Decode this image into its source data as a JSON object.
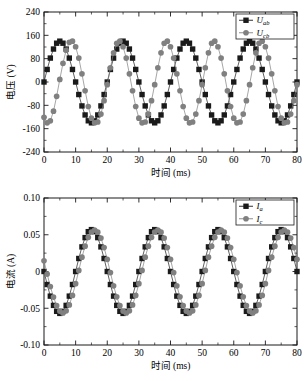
{
  "figure": {
    "background": "#ffffff",
    "series_colors": {
      "black": "#1a1a1a",
      "gray": "#808080"
    }
  },
  "chart_data": [
    {
      "type": "line",
      "title": "",
      "xlabel": "时间 (ms)",
      "ylabel": "电压 (V)",
      "xlim": [
        0,
        80
      ],
      "ylim": [
        -240,
        240
      ],
      "xticks": [
        0,
        10,
        20,
        30,
        40,
        50,
        60,
        70,
        80
      ],
      "yticks": [
        -240,
        -160,
        -80,
        0,
        80,
        160,
        240
      ],
      "xtick_labels": [
        "0",
        "10",
        "20",
        "30",
        "40",
        "50",
        "60",
        "70",
        "80"
      ],
      "ytick_labels": [
        "-240",
        "-160",
        "-80",
        "0",
        "80",
        "160",
        "240"
      ],
      "grid": false,
      "legend_position": "top-right",
      "amplitude": 140,
      "period_ms": 20,
      "x": [
        0,
        1,
        2,
        3,
        4,
        5,
        6,
        7,
        8,
        9,
        10,
        11,
        12,
        13,
        14,
        15,
        16,
        17,
        18,
        19,
        20,
        21,
        22,
        23,
        24,
        25,
        26,
        27,
        28,
        29,
        30,
        31,
        32,
        33,
        34,
        35,
        36,
        37,
        38,
        39,
        40,
        41,
        42,
        43,
        44,
        45,
        46,
        47,
        48,
        49,
        50,
        51,
        52,
        53,
        54,
        55,
        56,
        57,
        58,
        59,
        60,
        61,
        62,
        63,
        64,
        65,
        66,
        67,
        68,
        69,
        70,
        71,
        72,
        73,
        74,
        75,
        76,
        77,
        78,
        79,
        80
      ],
      "series": [
        {
          "name": "U_ab",
          "label": "U",
          "subscript": "ab",
          "marker": "square",
          "color": "#1a1a1a",
          "phase_deg": 0,
          "values": [
            0,
            43,
            82,
            113,
            133,
            140,
            133,
            113,
            82,
            43,
            0,
            -43,
            -82,
            -113,
            -133,
            -140,
            -133,
            -113,
            -82,
            -43,
            0,
            43,
            82,
            113,
            133,
            140,
            133,
            113,
            82,
            43,
            0,
            -43,
            -82,
            -113,
            -133,
            -140,
            -133,
            -113,
            -82,
            -43,
            0,
            43,
            82,
            113,
            133,
            140,
            133,
            113,
            82,
            43,
            0,
            -43,
            -82,
            -113,
            -133,
            -140,
            -133,
            -113,
            -82,
            -43,
            0,
            43,
            82,
            113,
            133,
            140,
            133,
            113,
            82,
            43,
            0,
            -43,
            -82,
            -113,
            -133,
            -140,
            -133,
            -113,
            -82,
            -43,
            0
          ]
        },
        {
          "name": "U_cb",
          "label": "U",
          "subscript": "cb",
          "marker": "circle",
          "color": "#808080",
          "phase_deg": -120,
          "values": [
            -121,
            -140,
            -133,
            -100,
            -49,
            9,
            64,
            109,
            136,
            140,
            121,
            82,
            28,
            -30,
            -84,
            -124,
            -140,
            -137,
            -110,
            -64,
            -9,
            49,
            100,
            133,
            140,
            121,
            82,
            28,
            -30,
            -84,
            -124,
            -140,
            -137,
            -110,
            -64,
            -9,
            49,
            100,
            133,
            140,
            121,
            82,
            28,
            -30,
            -84,
            -124,
            -140,
            -137,
            -110,
            -64,
            -9,
            49,
            100,
            133,
            140,
            121,
            82,
            28,
            -30,
            -84,
            -124,
            -140,
            -137,
            -110,
            -64,
            -9,
            49,
            100,
            133,
            140,
            121,
            82,
            28,
            -30,
            -84,
            -124,
            -140,
            -137,
            -110,
            -64,
            -9
          ]
        }
      ]
    },
    {
      "type": "line",
      "title": "",
      "xlabel": "时间 (ms)",
      "ylabel": "电流 (A)",
      "xlim": [
        0,
        80
      ],
      "ylim": [
        -0.1,
        0.1
      ],
      "xticks": [
        0,
        10,
        20,
        30,
        40,
        50,
        60,
        70,
        80
      ],
      "yticks": [
        -0.1,
        -0.05,
        0,
        0.05,
        0.1
      ],
      "xtick_labels": [
        "0",
        "10",
        "20",
        "30",
        "40",
        "50",
        "60",
        "70",
        "80"
      ],
      "ytick_labels": [
        "-0.10",
        "-0.05",
        "0",
        "0.05",
        "0.10"
      ],
      "grid": false,
      "legend_position": "top-right",
      "amplitude": 0.057,
      "period_ms": 20,
      "x": [
        0,
        1,
        2,
        3,
        4,
        5,
        6,
        7,
        8,
        9,
        10,
        11,
        12,
        13,
        14,
        15,
        16,
        17,
        18,
        19,
        20,
        21,
        22,
        23,
        24,
        25,
        26,
        27,
        28,
        29,
        30,
        31,
        32,
        33,
        34,
        35,
        36,
        37,
        38,
        39,
        40,
        41,
        42,
        43,
        44,
        45,
        46,
        47,
        48,
        49,
        50,
        51,
        52,
        53,
        54,
        55,
        56,
        57,
        58,
        59,
        60,
        61,
        62,
        63,
        64,
        65,
        66,
        67,
        68,
        69,
        70,
        71,
        72,
        73,
        74,
        75,
        76,
        77,
        78,
        79,
        80
      ],
      "series": [
        {
          "name": "I_a",
          "label": "I",
          "subscript": "a",
          "marker": "square",
          "color": "#1a1a1a",
          "phase_deg": 180,
          "values": [
            0,
            -0.0177,
            -0.0335,
            -0.0461,
            -0.0542,
            -0.057,
            -0.0542,
            -0.0461,
            -0.0335,
            -0.0177,
            0,
            0.0177,
            0.0335,
            0.0461,
            0.0542,
            0.057,
            0.0542,
            0.0461,
            0.0335,
            0.0177,
            0,
            -0.0177,
            -0.0335,
            -0.0461,
            -0.0542,
            -0.057,
            -0.0542,
            -0.0461,
            -0.0335,
            -0.0177,
            0,
            0.0177,
            0.0335,
            0.0461,
            0.0542,
            0.057,
            0.0542,
            0.0461,
            0.0335,
            0.0177,
            0,
            -0.0177,
            -0.0335,
            -0.0461,
            -0.0542,
            -0.057,
            -0.0542,
            -0.0461,
            -0.0335,
            -0.0177,
            0,
            0.0177,
            0.0335,
            0.0461,
            0.0542,
            0.057,
            0.0542,
            0.0461,
            0.0335,
            0.0177,
            0,
            -0.0177,
            -0.0335,
            -0.0461,
            -0.0542,
            -0.057,
            -0.0542,
            -0.0461,
            -0.0335,
            -0.0177,
            0,
            0.0177,
            0.0335,
            0.0461,
            0.0542,
            0.057,
            0.0542,
            0.0461,
            0.0335,
            0.0177,
            0
          ]
        },
        {
          "name": "I_c",
          "label": "I",
          "subscript": "c",
          "marker": "circle",
          "color": "#808080",
          "phase_deg": 185,
          "values": [
            0.0145,
            -0.0035,
            -0.0205,
            -0.0348,
            -0.0465,
            -0.0538,
            -0.0565,
            -0.0535,
            -0.0455,
            -0.0325,
            -0.0165,
            0.0015,
            0.0195,
            0.0345,
            0.0465,
            0.0538,
            0.0565,
            0.0535,
            0.0455,
            0.0325,
            0.0165,
            -0.0015,
            -0.0195,
            -0.0345,
            -0.0465,
            -0.0538,
            -0.0565,
            -0.0535,
            -0.0455,
            -0.0325,
            -0.0165,
            0.0015,
            0.0195,
            0.0345,
            0.0465,
            0.0538,
            0.0565,
            0.0535,
            0.0455,
            0.0325,
            0.0165,
            -0.0015,
            -0.0195,
            -0.0345,
            -0.0465,
            -0.0538,
            -0.0565,
            -0.0535,
            -0.0455,
            -0.0325,
            -0.0165,
            0.0015,
            0.0195,
            0.0345,
            0.0465,
            0.0538,
            0.0565,
            0.0535,
            0.0455,
            0.0325,
            0.0165,
            -0.0015,
            -0.0195,
            -0.0345,
            -0.0465,
            -0.0538,
            -0.0565,
            -0.0535,
            -0.0455,
            -0.0325,
            -0.0165,
            0.0015,
            0.0195,
            0.0345,
            0.0465,
            0.0538,
            0.0565,
            0.0535,
            0.0455,
            0.0325,
            0.0165
          ]
        }
      ]
    }
  ]
}
